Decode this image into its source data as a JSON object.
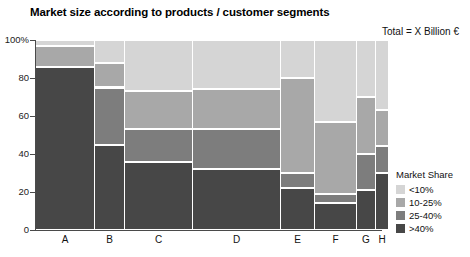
{
  "title": "Market size according to products / customer segments",
  "total_label": "Total = X Billion €",
  "axis": {
    "y_ticks": [
      "100%",
      "80",
      "60",
      "40",
      "20",
      "0"
    ],
    "y_tick_values": [
      100,
      80,
      60,
      40,
      20,
      0
    ],
    "x_labels": [
      "A",
      "B",
      "C",
      "D",
      "E",
      "F",
      "G",
      "H"
    ]
  },
  "legend": {
    "title": "Market Share",
    "items": [
      {
        "label": "<10%",
        "color": "#d5d5d5"
      },
      {
        "label": "10-25%",
        "color": "#a8a8a8"
      },
      {
        "label": "25-40%",
        "color": "#7d7d7d"
      },
      {
        "label": ">40%",
        "color": "#474747"
      }
    ]
  },
  "chart_data": {
    "type": "bar",
    "subtype": "marimekko",
    "title": "Market size according to products / customer segments",
    "xlabel": "",
    "ylabel": "",
    "ylim": [
      0,
      100
    ],
    "grid": false,
    "legend_position": "right",
    "annotations": [
      "Total = X Billion €"
    ],
    "categories": [
      "A",
      "B",
      "C",
      "D",
      "E",
      "F",
      "G",
      "H"
    ],
    "column_widths_pct": [
      16.8,
      8.4,
      19.4,
      25.2,
      9.6,
      11.9,
      5.2,
      3.5
    ],
    "series": [
      {
        "name": "<10%",
        "color": "#d5d5d5",
        "values": [
          3,
          12,
          27,
          26,
          20,
          43,
          30,
          37
        ]
      },
      {
        "name": "10-25%",
        "color": "#a8a8a8",
        "values": [
          11,
          13,
          20,
          21,
          50,
          38,
          30,
          19
        ]
      },
      {
        "name": "25-40%",
        "color": "#7d7d7d",
        "values": [
          0,
          30,
          17,
          21,
          8,
          5,
          19,
          14
        ]
      },
      {
        "name": ">40%",
        "color": "#474747",
        "values": [
          86,
          45,
          36,
          32,
          22,
          14,
          21,
          30
        ]
      }
    ],
    "stack_tops": {
      "A": [
        100,
        97,
        86,
        86
      ],
      "B": [
        100,
        88,
        75,
        45
      ],
      "C": [
        100,
        73,
        53,
        36
      ],
      "D": [
        100,
        74,
        53,
        32
      ],
      "E": [
        100,
        80,
        30,
        22
      ],
      "F": [
        100,
        57,
        19,
        14
      ],
      "G": [
        100,
        70,
        40,
        21
      ],
      "H": [
        100,
        63,
        44,
        30
      ]
    }
  },
  "geometry": {
    "columns": [
      {
        "name": "A",
        "x": 0,
        "w": 58
      },
      {
        "name": "B",
        "x": 59,
        "w": 29
      },
      {
        "name": "C",
        "x": 89,
        "w": 67
      },
      {
        "name": "D",
        "x": 157,
        "w": 87
      },
      {
        "name": "E",
        "x": 245,
        "w": 33
      },
      {
        "name": "F",
        "x": 279,
        "w": 41
      },
      {
        "name": "G",
        "x": 321,
        "w": 18
      },
      {
        "name": "H",
        "x": 340,
        "w": 12
      }
    ]
  }
}
